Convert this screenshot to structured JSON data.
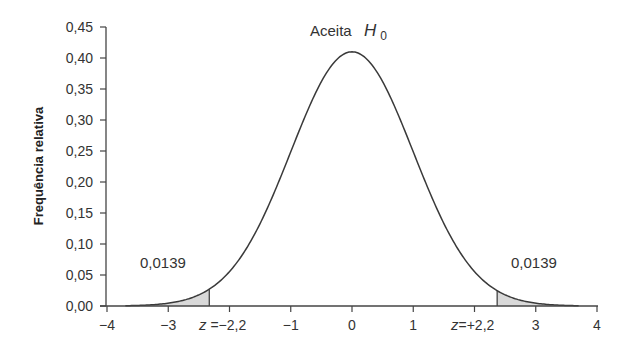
{
  "chart_data": {
    "type": "area",
    "title": "",
    "xlabel": "",
    "ylabel": "Frequência relativa",
    "xlim": [
      -4,
      4
    ],
    "ylim": [
      0,
      0.45
    ],
    "grid": false,
    "legend": null,
    "x_ticks": [
      "−4",
      "−3",
      "−2",
      "−1",
      "0",
      "1",
      "2",
      "3",
      "4"
    ],
    "x_tick_values": [
      -4,
      -3,
      -2,
      -1,
      0,
      1,
      2,
      3,
      4
    ],
    "x_tick_display": [
      "−4",
      "−3",
      "z =−2,2",
      "−1",
      "0",
      "1",
      "z=+2,2",
      "3",
      "4"
    ],
    "y_ticks": [
      "0,00",
      "0,05",
      "0,10",
      "0,15",
      "0,20",
      "0,25",
      "0,30",
      "0,35",
      "0,40",
      "0,45"
    ],
    "y_tick_values": [
      0,
      0.05,
      0.1,
      0.15,
      0.2,
      0.25,
      0.3,
      0.35,
      0.4,
      0.45
    ],
    "series": [
      {
        "name": "Distribuição normal padrão",
        "function": "standard_normal_pdf",
        "x_range": [
          -3.7,
          3.7
        ],
        "peak": 0.41
      }
    ],
    "shaded_regions": [
      {
        "name": "left-rejection-tail",
        "x_from": -3.7,
        "x_to": -2.33,
        "label": "0,0139"
      },
      {
        "name": "right-rejection-tail",
        "x_from": 2.37,
        "x_to": 3.7,
        "label": "0,0139"
      }
    ],
    "annotations": [
      {
        "text": "Aceita",
        "subtext": "H",
        "subscript": "0",
        "x": 0,
        "y": 0.44
      },
      {
        "text": "0,0139",
        "x": -3.2,
        "y": 0.075
      },
      {
        "text": "0,0139",
        "x": 3.2,
        "y": 0.075
      },
      {
        "text": "z =−2,2",
        "x": -2.2,
        "y": -0.03
      },
      {
        "text": "z=+2,2",
        "x": 2.2,
        "y": -0.03
      }
    ]
  },
  "labels": {
    "ylabel": "Frequência relativa",
    "accept": "Aceita",
    "h": "H",
    "h_sub": "0",
    "left_tail": "0,0139",
    "right_tail": "0,0139",
    "z_left_prefix": "z",
    "z_left_value": " =−2,2",
    "z_right_prefix": "z",
    "z_right_value": "=+2,2"
  },
  "colors": {
    "curve": "#3a3a3a",
    "axis": "#444444",
    "shade": "#d9d9d9",
    "background": "#ffffff"
  }
}
